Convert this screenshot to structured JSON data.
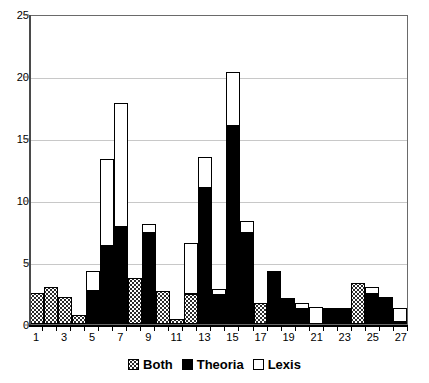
{
  "chart_data": {
    "type": "bar",
    "stacked": true,
    "title": "",
    "subtitle": "",
    "xlabel": "",
    "ylabel": "",
    "ylim": [
      0,
      25
    ],
    "yticks": [
      0,
      5,
      10,
      15,
      20,
      25
    ],
    "grid": true,
    "legend_position": "bottom",
    "categories": [
      "1",
      "2",
      "3",
      "4",
      "5",
      "6",
      "7",
      "8",
      "9",
      "10",
      "11",
      "12",
      "13",
      "14",
      "15",
      "16",
      "17",
      "18",
      "19",
      "20",
      "21",
      "22",
      "23",
      "24",
      "25",
      "26",
      "27"
    ],
    "xtick_labels": [
      "1",
      "3",
      "5",
      "7",
      "9",
      "11",
      "13",
      "15",
      "17",
      "19",
      "21",
      "23",
      "25",
      "27"
    ],
    "series": [
      {
        "name": "Both",
        "style": "dotted-pattern",
        "color": "#ffffff",
        "values": [
          2.5,
          3.0,
          2.2,
          0.7,
          0,
          0,
          0,
          3.7,
          0,
          2.7,
          0.4,
          2.4,
          0,
          0,
          0,
          0,
          1.7,
          0,
          0,
          0,
          0,
          0,
          0,
          3.3,
          0,
          0,
          0.15
        ]
      },
      {
        "name": "Theoria",
        "style": "solid-black",
        "color": "#000000",
        "values": [
          0,
          0,
          0,
          0,
          2.7,
          6.3,
          7.8,
          0,
          7.3,
          0,
          0,
          0,
          11.0,
          2.3,
          16.0,
          7.3,
          0,
          4.1,
          1.9,
          1.2,
          0,
          1.3,
          1.3,
          0,
          2.4,
          2.2,
          0
        ]
      },
      {
        "name": "Lexis",
        "style": "solid-white",
        "color": "#ffffff",
        "values": [
          0,
          0,
          0,
          0,
          1.6,
          7.0,
          10.0,
          0,
          0.8,
          0,
          0,
          4.1,
          2.5,
          0.5,
          4.3,
          1.0,
          0,
          0.2,
          0.2,
          0.5,
          1.4,
          0,
          0,
          0,
          0.6,
          0,
          1.15
        ]
      }
    ],
    "totals": [
      2.5,
      3.0,
      2.2,
      0.7,
      4.3,
      13.3,
      17.8,
      3.7,
      8.1,
      2.7,
      0.4,
      6.5,
      13.5,
      2.8,
      20.3,
      8.3,
      1.7,
      4.3,
      2.1,
      1.7,
      1.4,
      1.3,
      1.3,
      3.3,
      3.0,
      2.2,
      1.3
    ]
  },
  "legend": {
    "items": [
      {
        "label": "Both"
      },
      {
        "label": "Theoria"
      },
      {
        "label": "Lexis"
      }
    ]
  }
}
